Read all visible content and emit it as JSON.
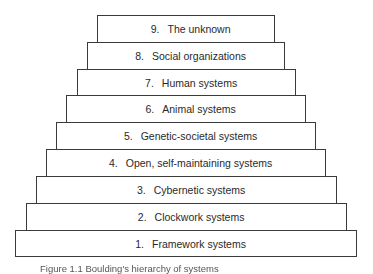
{
  "diagram": {
    "type": "stepped-hierarchy",
    "levels": [
      {
        "number": "1.",
        "label": "Framework systems"
      },
      {
        "number": "2.",
        "label": "Clockwork systems"
      },
      {
        "number": "3.",
        "label": "Cybernetic systems"
      },
      {
        "number": "4.",
        "label": "Open, self-maintaining systems"
      },
      {
        "number": "5.",
        "label": "Genetic-societal systems"
      },
      {
        "number": "6.",
        "label": "Animal systems"
      },
      {
        "number": "7.",
        "label": "Human systems"
      },
      {
        "number": "8.",
        "label": "Social organizations"
      },
      {
        "number": "9.",
        "label": "The unknown"
      }
    ],
    "caption": "Figure 1.1   Boulding's hierarchy of systems"
  }
}
